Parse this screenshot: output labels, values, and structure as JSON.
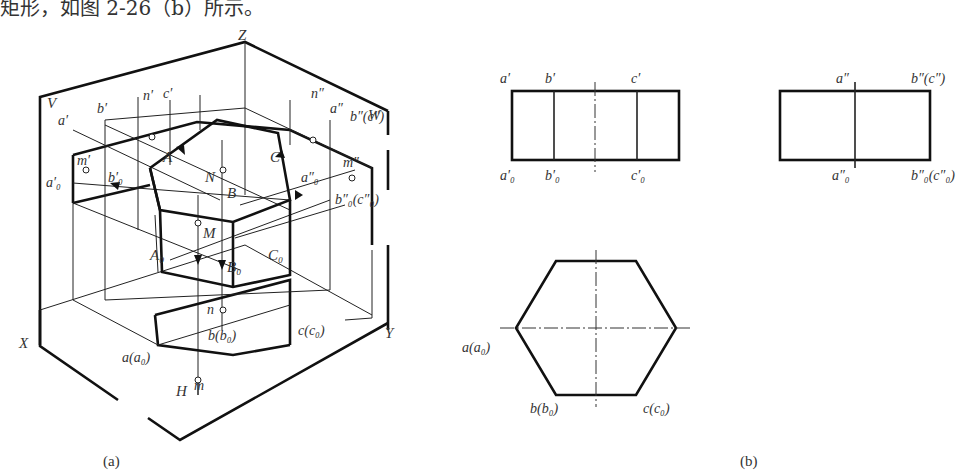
{
  "top_text": "矩形，如图 2-26（b）所示。",
  "figure_a": {
    "caption": "(a)",
    "axes": {
      "z": "Z",
      "x": "X",
      "y": "Y"
    },
    "planes": {
      "v": "V",
      "w": "W",
      "h": "H"
    },
    "labels": {
      "a_prime": "a′",
      "b_prime": "b′",
      "n_prime": "n′",
      "c_prime": "c′",
      "n_dprime": "n″",
      "a_dprime": "a″",
      "bc_dprime": "b″(c″)",
      "m_prime": "m′",
      "m_dprime": "m″",
      "a0_prime": "a′₀",
      "b0_prime": "b′₀",
      "a0_dprime": "a″₀",
      "b0c0_dprime": "b″₀(c″₀)",
      "A": "A",
      "B": "B",
      "C": "C",
      "N": "N",
      "M": "M",
      "A0": "A₀",
      "B0": "B₀",
      "C0": "C₀",
      "n": "n",
      "m": "m",
      "a_a0": "a(a₀)",
      "b_b0": "b(b₀)",
      "c_c0": "c(c₀)"
    }
  },
  "figure_b": {
    "caption": "(b)",
    "front_view": {
      "top_labels": [
        "a′",
        "b′",
        "c′"
      ],
      "bottom_labels": [
        "a′₀",
        "b′₀",
        "c′₀"
      ]
    },
    "side_view": {
      "top_labels": [
        "a″",
        "b″(c″)"
      ],
      "bottom_labels": [
        "a″₀",
        "b″₀(c″₀)"
      ]
    },
    "top_view": {
      "labels": [
        "a(a₀)",
        "b(b₀)",
        "c(c₀)"
      ]
    }
  }
}
